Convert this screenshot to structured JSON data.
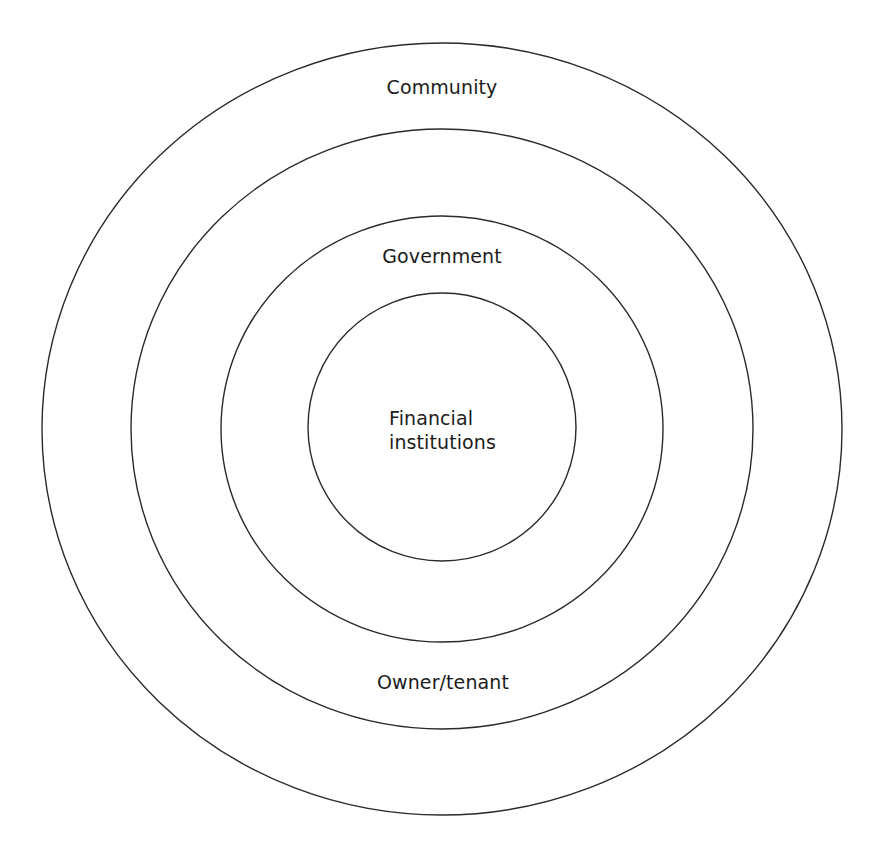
{
  "diagram": {
    "type": "concentric-rings",
    "center": {
      "x": 442,
      "y": 429
    },
    "rings": [
      {
        "name": "Community",
        "rx": 400,
        "ry": 386
      },
      {
        "name": "Owner/tenant",
        "rx": 311,
        "ry": 300
      },
      {
        "name": "Government",
        "rx": 221,
        "ry": 213
      },
      {
        "name": "Financial institutions",
        "rx": 134,
        "ry": 134
      }
    ],
    "stroke_color": "#2a2a2a",
    "background_color": "#ffffff"
  },
  "labels": {
    "community": "Community",
    "government": "Government",
    "owner_tenant": "Owner/tenant",
    "financial_line1": "Financial",
    "financial_line2": "institutions"
  }
}
